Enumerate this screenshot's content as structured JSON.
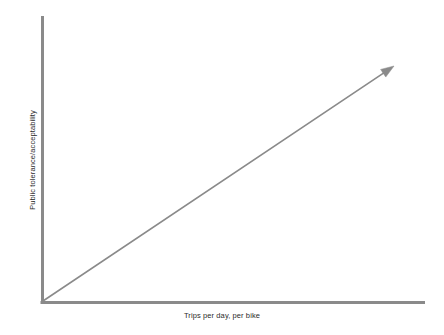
{
  "chart_data": {
    "type": "line",
    "title": "",
    "subtitle": "",
    "xlabel": "Trips per day, per bike",
    "ylabel": "Public tolerance/acceptability",
    "grid": false,
    "legend": false,
    "legend_position": "none",
    "axis_ticks": false,
    "tick_labels_x": [],
    "tick_labels_y": [],
    "xlim": [
      0,
      100
    ],
    "ylim": [
      0,
      100
    ],
    "annotations": [
      {
        "name": "upward-trend-arrow",
        "kind": "arrow",
        "description": "Straight upward-sloping arrow from origin to upper right indicating positive relationship",
        "from": [
          0,
          0
        ],
        "to": [
          92,
          83
        ]
      }
    ],
    "series": [
      {
        "name": "Public tolerance trend",
        "style": "arrow-line",
        "color": "#8a8a8a",
        "x": [
          0,
          92
        ],
        "values": [
          0,
          83
        ]
      }
    ]
  },
  "axes": {
    "x_label": "Trips per day, per bike",
    "y_label": "Public tolerance/acceptability",
    "axis_color": "#8a8a8a",
    "label_color": "#2b2b2b"
  },
  "colors": {
    "background": "#ffffff",
    "axis": "#8a8a8a",
    "trend": "#8a8a8a",
    "text": "#2b2b2b"
  },
  "geometry": {
    "origin_x": 42,
    "origin_y": 303,
    "y_axis_top": 16,
    "x_axis_right": 425,
    "arrow_tip_x": 394,
    "arrow_tip_y": 66
  }
}
